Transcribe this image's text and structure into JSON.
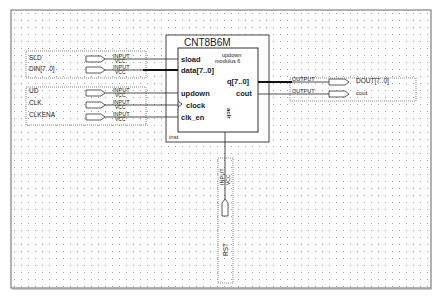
{
  "schematic": {
    "block": {
      "title": "CNT8B6M",
      "instance": "inst",
      "params": [
        "updown",
        "modulus 6"
      ],
      "ports_in": [
        "sload",
        "data[7..0]",
        "updown",
        "clock",
        "clk_en"
      ],
      "ports_out": [
        "q[7..0]",
        "cout"
      ],
      "port_bottom": "aclr"
    },
    "inputs": [
      {
        "name": "SLD",
        "type": "INPUT",
        "default": "VCC"
      },
      {
        "name": "DIN[7..0]",
        "type": "INPUT",
        "default": "VCC"
      },
      {
        "name": "UD",
        "type": "INPUT",
        "default": "VCC"
      },
      {
        "name": "CLK",
        "type": "INPUT",
        "default": "VCC"
      },
      {
        "name": "CLKENA",
        "type": "INPUT",
        "default": "VCC"
      }
    ],
    "outputs": [
      {
        "name": "DOUT[7..0]",
        "type": "OUTPUT"
      },
      {
        "name": "cout",
        "type": "OUTPUT"
      }
    ],
    "reset": {
      "name": "RST",
      "type": "INPUT",
      "default": "VCC"
    }
  },
  "colors": {
    "wire": "#1a1a1a",
    "grid_dot": "#9a9a9a",
    "frame": "#555555",
    "group_border": "#8a8a8a"
  }
}
